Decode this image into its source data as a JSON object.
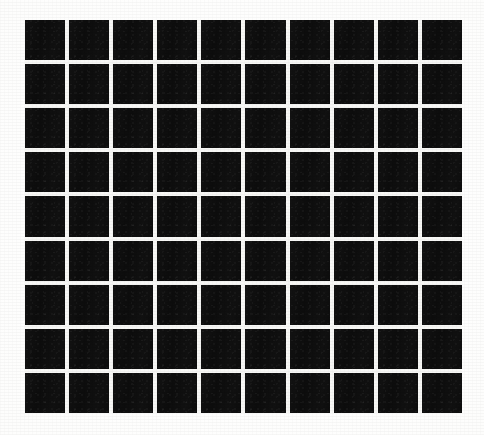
{
  "image": {
    "subject": "black-tile-grid",
    "description": "Scanned off-white page showing a rectangular grid of solid black squares separated by thin white grout lines",
    "alt_text": "Grid of black squares",
    "canvas": {
      "width": 484,
      "height": 435
    }
  },
  "grid": {
    "columns": 10,
    "rows": 9,
    "cell_count": 90,
    "left": 25,
    "top": 20,
    "width": 437,
    "height": 393,
    "gap_px": 4,
    "cell_width_px": 39.8,
    "cell_height_px": 39.2
  },
  "colors": {
    "tile": "#0d0d0d",
    "grout": "#f7f7f5",
    "background": "#fdfdfc",
    "paper_edge": "#f8f8f6"
  }
}
